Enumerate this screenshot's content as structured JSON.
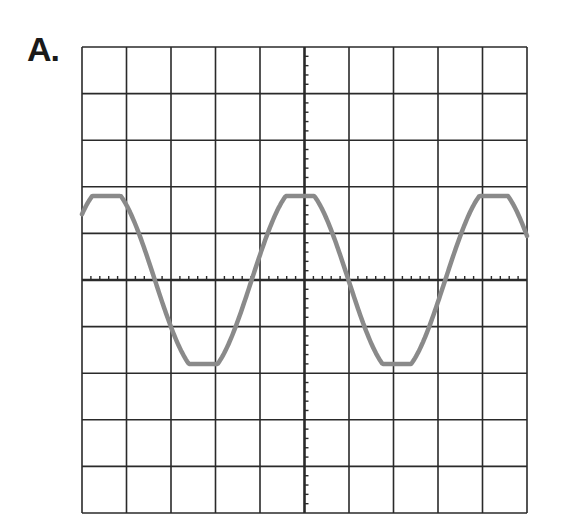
{
  "label": "A.",
  "chart_data": {
    "type": "line",
    "title": "A.",
    "xlabel": "",
    "ylabel": "",
    "grid": true,
    "grid_divisions": {
      "x": 10,
      "y": 10
    },
    "xlim": [
      -5,
      5
    ],
    "ylim": [
      -5,
      5
    ],
    "axes_minor_ticks_per_division": 5,
    "series": [
      {
        "name": "waveform",
        "shape": "sine",
        "amplitude_div": 1.8,
        "period_div": 4.35,
        "zero_crossings_div": [
          -3.45,
          -1.3,
          0.85,
          2.95
        ],
        "peaks_div": [
          -4.6,
          -0.1,
          4.0
        ],
        "troughs_div": [
          -2.4,
          1.95
        ],
        "color": "#888888"
      }
    ]
  },
  "colors": {
    "grid": "#2a2a2a",
    "wave": "#8a8a8a",
    "background": "#ffffff"
  }
}
